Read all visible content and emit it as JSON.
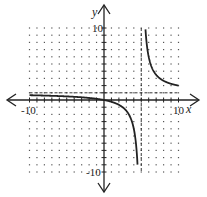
{
  "chart_data": {
    "type": "line",
    "title": "",
    "function": "f(x) = x/(x-5)",
    "xlabel": "x",
    "ylabel": "y",
    "xlim": [
      -10,
      10
    ],
    "ylim": [
      -10,
      10
    ],
    "grid": "dotted",
    "grid_step": 1,
    "tick_labels": {
      "x_min": "-10",
      "x_max": "10",
      "y_max": "10",
      "y_min": "-10"
    },
    "asymptotes": {
      "vertical": {
        "x": 5,
        "style": "dashed"
      },
      "horizontal": {
        "y": 1,
        "style": "dashed"
      }
    },
    "series": [
      {
        "name": "left branch",
        "x": [
          -10,
          -5,
          -2,
          0,
          2,
          3,
          4,
          4.5,
          4.9
        ],
        "y": [
          0.67,
          0.5,
          0.29,
          0,
          -0.67,
          -1.5,
          -4,
          -9,
          -10
        ]
      },
      {
        "name": "right branch",
        "x": [
          5.1,
          5.5,
          6,
          7,
          8,
          10
        ],
        "y": [
          10,
          11,
          6,
          3.5,
          2.67,
          2
        ]
      }
    ],
    "colors": {
      "curve": "#222222",
      "grid": "#555555",
      "axis": "#222222"
    }
  },
  "labels": {
    "x_axis": "x",
    "y_axis": "y",
    "x_min": "-10",
    "x_max": "10",
    "y_max": "10",
    "y_min": "-10"
  }
}
